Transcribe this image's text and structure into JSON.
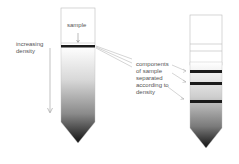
{
  "labels": {
    "sample": "sample",
    "density_axis": "increasing\ndensity",
    "components": "components\nof sample\nseparated\naccording to\ndensity"
  },
  "colors": {
    "band": "#1a1a1a",
    "tube_outline": "#bbbbbb",
    "gradient_dark": "#111111",
    "text": "#555555"
  }
}
